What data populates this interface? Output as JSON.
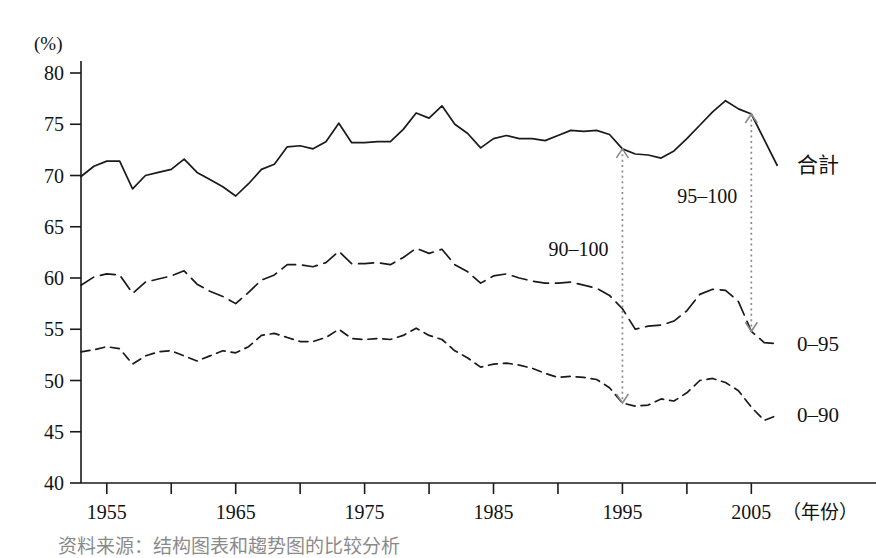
{
  "chart_data": {
    "type": "line",
    "title": "",
    "subtitle": "",
    "xlabel": "年份",
    "xlabel_display": "（年份）",
    "ylabel": "",
    "y_unit": "(%)",
    "xlim": [
      1953,
      2008
    ],
    "ylim": [
      40,
      80
    ],
    "y_ticks": [
      40,
      45,
      50,
      55,
      60,
      65,
      70,
      75,
      80
    ],
    "x_ticks": [
      1955,
      1960,
      1965,
      1970,
      1975,
      1980,
      1985,
      1990,
      1995,
      2000,
      2005
    ],
    "x_tick_labels_shown": [
      "1955",
      "1965",
      "1975",
      "1985",
      "1995",
      "2005"
    ],
    "grid": false,
    "legend_position": "right-inline",
    "series": [
      {
        "name": "合計",
        "label": "合計",
        "style": "solid",
        "x": [
          1953,
          1954,
          1955,
          1956,
          1957,
          1958,
          1959,
          1960,
          1961,
          1962,
          1963,
          1964,
          1965,
          1966,
          1967,
          1968,
          1969,
          1970,
          1971,
          1972,
          1973,
          1974,
          1975,
          1976,
          1977,
          1978,
          1979,
          1980,
          1981,
          1982,
          1983,
          1984,
          1985,
          1986,
          1987,
          1988,
          1989,
          1990,
          1991,
          1992,
          1993,
          1994,
          1995,
          1996,
          1997,
          1998,
          1999,
          2000,
          2001,
          2002,
          2003,
          2004,
          2005,
          2006,
          2007
        ],
        "values": [
          69.9,
          70.9,
          71.4,
          71.4,
          68.7,
          70.0,
          70.3,
          70.6,
          71.6,
          70.3,
          69.6,
          68.9,
          68.0,
          69.2,
          70.6,
          71.1,
          72.8,
          72.9,
          72.6,
          73.3,
          75.1,
          73.2,
          73.2,
          73.3,
          73.3,
          74.5,
          76.1,
          75.6,
          76.8,
          75.0,
          74.1,
          72.7,
          73.6,
          73.9,
          73.6,
          73.6,
          73.4,
          73.9,
          74.4,
          74.3,
          74.4,
          74.0,
          72.6,
          72.1,
          72.0,
          71.7,
          72.4,
          73.6,
          74.9,
          76.2,
          77.3,
          76.5,
          76.0,
          73.5,
          71.0
        ]
      },
      {
        "name": "0–95",
        "label": "0–95",
        "style": "dashed",
        "x": [
          1953,
          1954,
          1955,
          1956,
          1957,
          1958,
          1959,
          1960,
          1961,
          1962,
          1963,
          1964,
          1965,
          1966,
          1967,
          1968,
          1969,
          1970,
          1971,
          1972,
          1973,
          1974,
          1975,
          1976,
          1977,
          1978,
          1979,
          1980,
          1981,
          1982,
          1983,
          1984,
          1985,
          1986,
          1987,
          1988,
          1989,
          1990,
          1991,
          1992,
          1993,
          1994,
          1995,
          1996,
          1997,
          1998,
          1999,
          2000,
          2001,
          2002,
          2003,
          2004,
          2005,
          2006,
          2007
        ],
        "values": [
          59.3,
          60.1,
          60.4,
          60.3,
          58.5,
          59.6,
          59.9,
          60.2,
          60.7,
          59.4,
          58.7,
          58.2,
          57.5,
          58.6,
          59.8,
          60.3,
          61.3,
          61.3,
          61.1,
          61.5,
          62.6,
          61.4,
          61.4,
          61.5,
          61.3,
          62.0,
          62.9,
          62.4,
          62.8,
          61.3,
          60.6,
          59.5,
          60.2,
          60.4,
          60.0,
          59.7,
          59.5,
          59.5,
          59.6,
          59.3,
          59.0,
          58.3,
          57.0,
          55.0,
          55.3,
          55.4,
          55.8,
          56.8,
          58.4,
          58.9,
          58.8,
          57.7,
          54.8,
          53.7,
          53.6
        ]
      },
      {
        "name": "0–90",
        "label": "0–90",
        "style": "dotted",
        "x": [
          1953,
          1954,
          1955,
          1956,
          1957,
          1958,
          1959,
          1960,
          1961,
          1962,
          1963,
          1964,
          1965,
          1966,
          1967,
          1968,
          1969,
          1970,
          1971,
          1972,
          1973,
          1974,
          1975,
          1976,
          1977,
          1978,
          1979,
          1980,
          1981,
          1982,
          1983,
          1984,
          1985,
          1986,
          1987,
          1988,
          1989,
          1990,
          1991,
          1992,
          1993,
          1994,
          1995,
          1996,
          1997,
          1998,
          1999,
          2000,
          2001,
          2002,
          2003,
          2004,
          2005,
          2006,
          2007
        ],
        "values": [
          52.8,
          53.0,
          53.3,
          53.1,
          51.6,
          52.4,
          52.8,
          52.9,
          52.4,
          51.9,
          52.4,
          52.9,
          52.7,
          53.3,
          54.4,
          54.6,
          54.2,
          53.8,
          53.8,
          54.2,
          55.0,
          54.1,
          54.0,
          54.1,
          54.0,
          54.4,
          55.1,
          54.4,
          54.0,
          52.9,
          52.2,
          51.3,
          51.6,
          51.7,
          51.5,
          51.2,
          50.7,
          50.3,
          50.4,
          50.3,
          50.1,
          49.3,
          47.8,
          47.5,
          47.6,
          48.2,
          48.0,
          48.8,
          50.0,
          50.2,
          49.8,
          49.0,
          47.4,
          46.1,
          46.6
        ]
      }
    ],
    "annotations": [
      {
        "label": "90–100",
        "at_year": 1995,
        "from_series": "合計",
        "to_series": "0–90",
        "arrow": "double",
        "style": "dotted",
        "color": "#8a8a8a"
      },
      {
        "label": "95–100",
        "at_year": 2005,
        "from_series": "合計",
        "to_series": "0–95",
        "arrow": "double",
        "style": "dotted",
        "color": "#8a8a8a"
      }
    ],
    "colors": {
      "line": "#1a1a1a",
      "axis": "#1a1a1a",
      "annotation": "#8a8a8a",
      "background": "#ffffff"
    }
  },
  "caption": {
    "partial_text": "资料来源：结构图表和趨势图的比较分析"
  }
}
